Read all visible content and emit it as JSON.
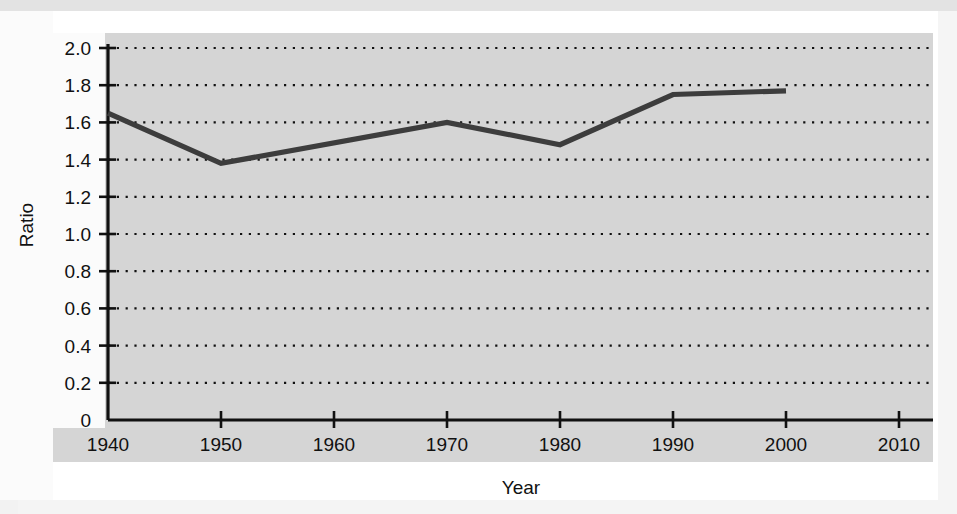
{
  "chart_data": {
    "type": "line",
    "title": "",
    "xlabel": "Year",
    "ylabel": "Ratio",
    "xlim": [
      1940,
      2013
    ],
    "ylim": [
      0,
      2.08
    ],
    "grid": true,
    "grid_style": "dotted-horizontal",
    "legend": "none",
    "x_tick_labels": [
      "1940",
      "1950",
      "1960",
      "1970",
      "1980",
      "1990",
      "2000",
      "2010"
    ],
    "x_ticks": [
      1940,
      1950,
      1960,
      1970,
      1980,
      1990,
      2000,
      2010
    ],
    "y_tick_labels": [
      "0",
      "0.2",
      "0.4",
      "0.6",
      "0.8",
      "1.0",
      "1.2",
      "1.4",
      "1.6",
      "1.8",
      "2.0"
    ],
    "y_ticks": [
      0,
      0.2,
      0.4,
      0.6,
      0.8,
      1.0,
      1.2,
      1.4,
      1.6,
      1.8,
      2.0
    ],
    "series": [
      {
        "name": "Ratio",
        "color": "#3d3d3d",
        "x": [
          1940,
          1950,
          1970,
          1980,
          1990,
          2000
        ],
        "values": [
          1.65,
          1.38,
          1.6,
          1.48,
          1.75,
          1.77
        ]
      }
    ]
  },
  "colors": {
    "panel_background": "#d5d5d5",
    "line_color": "#3d3d3d",
    "axis_color": "#111111",
    "grid_color": "#111111",
    "page_background": "#ffffff"
  }
}
